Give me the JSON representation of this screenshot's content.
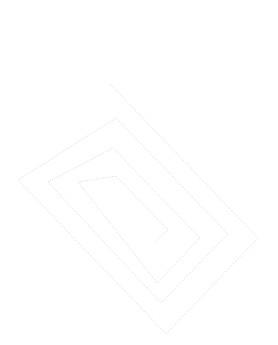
{
  "figure": {
    "kind": "vector-line-drawing",
    "background_color": "#ffffff",
    "canvas": {
      "width": 278,
      "height": 345
    }
  },
  "drawing": {
    "name": "rotated-rectangular-spiral",
    "stroke_color": "#b9b9bd",
    "stroke_width": 0.7,
    "stroke_style": "dotted",
    "dash_pattern": "0.7 1.6",
    "rotation_degrees": -40,
    "turns": 3.5,
    "center": {
      "x": 138,
      "y": 209
    },
    "spiral_points": [
      [
        110,
        84
      ],
      [
        258,
        238
      ],
      [
        166,
        334
      ],
      [
        18,
        180
      ],
      [
        116,
        118
      ],
      [
        228,
        234
      ],
      [
        161,
        303
      ],
      [
        48,
        182
      ],
      [
        113,
        148
      ],
      [
        200,
        238
      ],
      [
        157,
        283
      ],
      [
        78,
        182
      ],
      [
        116,
        176
      ],
      [
        168,
        230
      ],
      [
        154,
        243
      ]
    ]
  },
  "labels": {
    "empty_caption": ""
  }
}
